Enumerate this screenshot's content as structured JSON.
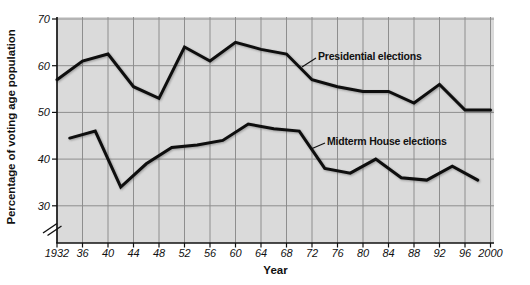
{
  "colors": {
    "page_bg": "#ffffff",
    "plot_bg": "#dadada",
    "grid": "#8e8e8e",
    "line": "#0e0e0e",
    "axis": "#111111",
    "text": "#111111"
  },
  "chart_data": {
    "type": "line",
    "title": "",
    "xlabel": "Year",
    "ylabel": "Percentage of voting age population",
    "grid": true,
    "legend_position": "inline-annotations",
    "axis_break_below": 30,
    "xlim": [
      1932,
      2000
    ],
    "ylim": [
      22,
      70.5
    ],
    "yticks": [
      30,
      40,
      50,
      60,
      70
    ],
    "ytick_labels": [
      "30",
      "40",
      "50",
      "60",
      "70"
    ],
    "xticks": [
      1932,
      1936,
      1940,
      1944,
      1948,
      1952,
      1956,
      1960,
      1964,
      1968,
      1972,
      1976,
      1980,
      1984,
      1988,
      1992,
      1996,
      2000
    ],
    "xtick_labels": [
      "1932",
      "36",
      "40",
      "44",
      "48",
      "52",
      "56",
      "60",
      "64",
      "68",
      "72",
      "76",
      "80",
      "84",
      "88",
      "92",
      "96",
      "2000"
    ],
    "series": [
      {
        "name": "Presidential elections",
        "x": [
          1932,
          1936,
          1940,
          1944,
          1948,
          1952,
          1956,
          1960,
          1964,
          1968,
          1972,
          1976,
          1980,
          1984,
          1988,
          1992,
          1996,
          2000
        ],
        "values": [
          57,
          61,
          62.5,
          55.5,
          53,
          64,
          61,
          65,
          63.5,
          62.5,
          57,
          55.5,
          54.5,
          54.5,
          52,
          56,
          50.5,
          50.5
        ]
      },
      {
        "name": "Midterm House elections",
        "x": [
          1934,
          1938,
          1942,
          1946,
          1950,
          1954,
          1958,
          1962,
          1966,
          1970,
          1974,
          1978,
          1982,
          1986,
          1990,
          1994,
          1998
        ],
        "values": [
          44.5,
          46,
          34,
          39,
          42.5,
          43,
          44,
          47.5,
          46.5,
          46,
          38,
          37,
          40,
          36,
          35.5,
          38.5,
          35.5
        ]
      }
    ],
    "annotations": [
      {
        "text": "Presidential elections",
        "label_x": 318,
        "label_y": 57,
        "pointer": [
          302,
          67,
          316,
          58
        ]
      },
      {
        "text": "Midterm House elections",
        "label_x": 327,
        "label_y": 142,
        "pointer": [
          311,
          149,
          325,
          143
        ]
      }
    ]
  }
}
